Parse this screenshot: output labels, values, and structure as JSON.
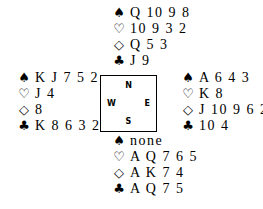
{
  "suits": {
    "spades": "♠",
    "hearts": "♡",
    "diamonds": "◇",
    "clubs": "♣"
  },
  "hands": {
    "north": {
      "spades": "Q 10 9 8",
      "hearts": "10 9 3 2",
      "diamonds": "Q 5 3",
      "clubs": "J 9"
    },
    "west": {
      "spades": "K J 7 5 2",
      "hearts": "J 4",
      "diamonds": "8",
      "clubs": "K 8 6 3 2"
    },
    "east": {
      "spades": "A 6 4 3",
      "hearts": "K 8",
      "diamonds": "J 10 9 6 2",
      "clubs": "10 4"
    },
    "south": {
      "spades": "none",
      "hearts": "A Q 7 6 5",
      "diamonds": "A K 7 4",
      "clubs": "A Q 7 5"
    }
  },
  "compass": {
    "north": "N",
    "south": "S",
    "east": "E",
    "west": "W"
  }
}
